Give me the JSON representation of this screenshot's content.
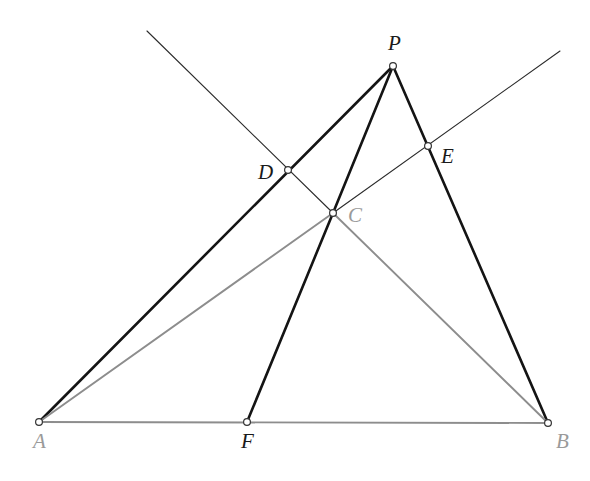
{
  "figure": {
    "canvas": {
      "width": 590,
      "height": 481,
      "background": "#ffffff"
    },
    "colors": {
      "thick_black": "#141414",
      "thin_black": "#2b2b2b",
      "gray_line": "#8d8d8d",
      "label_dark": "#1a1a1a",
      "label_gray": "#9a9a9a",
      "vertex_fill": "#ffffff",
      "vertex_stroke": "#333333"
    },
    "stroke_widths": {
      "thick": 2.6,
      "thin": 1.1,
      "gray": 1.9
    },
    "points": [
      {
        "id": "A",
        "label": "A",
        "x": 39,
        "y": 422,
        "label_x": 33,
        "label_y": 448,
        "label_color": "gray",
        "marker": true
      },
      {
        "id": "B",
        "label": "B",
        "x": 548,
        "y": 423,
        "label_x": 556,
        "label_y": 448,
        "label_color": "gray",
        "marker": true
      },
      {
        "id": "C",
        "label": "C",
        "x": 333,
        "y": 213,
        "label_x": 348,
        "label_y": 222,
        "label_color": "gray",
        "marker": true
      },
      {
        "id": "D",
        "label": "D",
        "x": 288,
        "y": 170,
        "label_x": 258,
        "label_y": 179,
        "label_color": "dark",
        "marker": true
      },
      {
        "id": "E",
        "label": "E",
        "x": 428,
        "y": 146,
        "label_x": 441,
        "label_y": 163,
        "label_color": "dark",
        "marker": true
      },
      {
        "id": "F",
        "label": "F",
        "x": 247,
        "y": 422,
        "label_x": 241,
        "label_y": 448,
        "label_color": "dark",
        "marker": true
      },
      {
        "id": "P",
        "label": "P",
        "x": 393,
        "y": 66,
        "label_x": 388,
        "label_y": 50,
        "label_color": "dark",
        "marker": true
      }
    ],
    "segments": [
      {
        "name": "segment-A-P-through-D",
        "from": [
          39,
          422
        ],
        "to": [
          393,
          66
        ],
        "style": "thick"
      },
      {
        "name": "segment-P-B-through-E",
        "from": [
          393,
          66
        ],
        "to": [
          548,
          423
        ],
        "style": "thick"
      },
      {
        "name": "segment-P-C",
        "from": [
          393,
          66
        ],
        "to": [
          333,
          213
        ],
        "style": "thick"
      },
      {
        "name": "segment-C-F",
        "from": [
          333,
          213
        ],
        "to": [
          247,
          422
        ],
        "style": "thick"
      },
      {
        "name": "segment-A-B",
        "from": [
          39,
          422
        ],
        "to": [
          548,
          423
        ],
        "style": "gray"
      },
      {
        "name": "segment-A-C",
        "from": [
          39,
          422
        ],
        "to": [
          333,
          213
        ],
        "style": "gray"
      },
      {
        "name": "segment-C-B",
        "from": [
          333,
          213
        ],
        "to": [
          548,
          423
        ],
        "style": "gray"
      },
      {
        "name": "ray-upper-left-through-D-to-C",
        "from": [
          147,
          31
        ],
        "to": [
          333,
          213
        ],
        "style": "thin"
      },
      {
        "name": "ray-C-through-E-to-upper-right",
        "from": [
          333,
          213
        ],
        "to": [
          560,
          51
        ],
        "style": "thin"
      }
    ]
  }
}
